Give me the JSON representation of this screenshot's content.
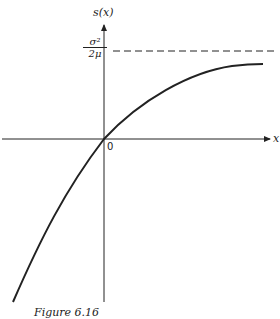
{
  "figure": {
    "y_axis_label": "s(x)",
    "x_axis_label": "x",
    "origin_label": "0",
    "asymptote_label": {
      "numerator": "σ²",
      "denominator": "2μ"
    },
    "caption": "Figure 6.16"
  },
  "colors": {
    "ink": "#222222",
    "background": "#ffffff"
  }
}
